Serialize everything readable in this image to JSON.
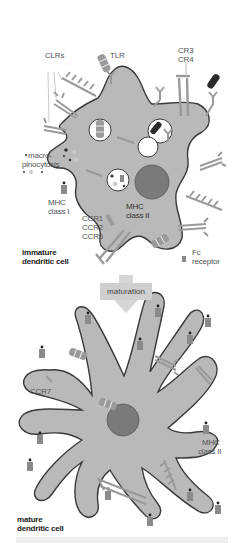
{
  "figure": {
    "colors": {
      "cell_fill": "#b9b9b9",
      "cell_outline": "#3a3a3a",
      "nucleus": "#7a7a7a",
      "receptor": "#9a9a9a",
      "vesicle_fill": "#ffffff",
      "arrow": "#d0d0d0",
      "label_text": "#555555",
      "bold_label_text": "#222222"
    }
  },
  "immature": {
    "title_line1": "immature",
    "title_line2": "dendritic cell",
    "labels": {
      "clrs": "CLRs",
      "tlr": "TLR",
      "cr3": "CR3",
      "cr4": "CR4",
      "macro": "macro-",
      "pinocytosis": "pinocytosis",
      "mhc1_line1": "MHC",
      "mhc1_line2": "class I",
      "mhc2_line1": "MHC",
      "mhc2_line2": "class II",
      "ccr1": "CCR1",
      "ccr2": "CCR2",
      "ccr5": "CCR5",
      "fc_line1": "Fc",
      "fc_line2": "receptor"
    }
  },
  "transition": {
    "label": "maturation"
  },
  "mature": {
    "title_line1": "mature",
    "title_line2": "dendritic cell",
    "labels": {
      "ccr7": "CCR7",
      "mhc2_line1": "MHC",
      "mhc2_line2": "class II"
    }
  }
}
